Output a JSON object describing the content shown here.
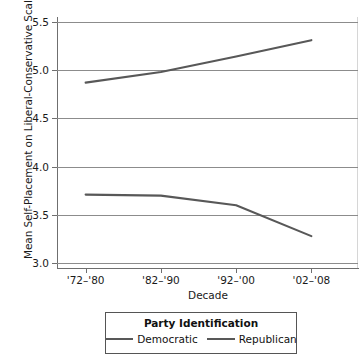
{
  "chart_data": {
    "type": "line",
    "title": "",
    "xlabel": "Decade",
    "ylabel": "Mean Self-Placement on Liberal-Conservative Scale",
    "categories": [
      "'72–'80",
      "'82–'90",
      "'92–'00",
      "'02–'08"
    ],
    "yticks": [
      "3.0",
      "3.5",
      "4.0",
      "4.5",
      "5.0",
      "5.5"
    ],
    "ytick_values": [
      3.0,
      3.5,
      4.0,
      4.5,
      5.0,
      5.5
    ],
    "ylim": [
      2.95,
      5.55
    ],
    "grid": true,
    "legend_position": "bottom",
    "legend_title": "Party Identification",
    "series": [
      {
        "name": "Democratic",
        "color": "#585858",
        "values": [
          3.71,
          3.7,
          3.6,
          3.28
        ]
      },
      {
        "name": "Republican",
        "color": "#585858",
        "values": [
          4.87,
          4.98,
          5.14,
          5.31
        ]
      }
    ]
  },
  "legend": {
    "title": "Party Identification",
    "entries": [
      {
        "label": "Democratic"
      },
      {
        "label": "Republican"
      }
    ]
  },
  "axes": {
    "x_title": "Decade",
    "y_title": "Mean Self-Placement on Liberal-Conservative Scale"
  },
  "colors": {
    "line": "#585858",
    "grid": "#8c8c8c",
    "axis": "#6f6f6f",
    "text": "#1a1a1a",
    "background": "#ffffff"
  }
}
